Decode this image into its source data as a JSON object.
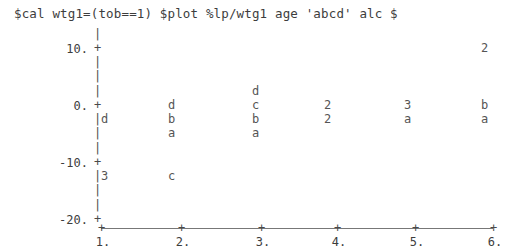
{
  "terminal": {
    "command": "$cal wtg1=(tob==1) $plot %lp/wtg1 age 'abcd' alc $",
    "foreground_color": "#4a4a4a",
    "background_color": "#ffffff"
  },
  "chart_data": {
    "type": "scatter",
    "title": "",
    "xlabel": "",
    "ylabel": "",
    "xlim": [
      1,
      6
    ],
    "ylim": [
      -20,
      10
    ],
    "grid": false,
    "legend": "none",
    "axis_style": "ascii",
    "y_ticks": [
      "10.",
      "0.",
      "-10.",
      "-20."
    ],
    "y_tick_values": [
      10,
      0,
      -10,
      -20
    ],
    "x_ticks": [
      "1.",
      "2.",
      "3.",
      "4.",
      "5.",
      "6."
    ],
    "x_tick_values": [
      1,
      2,
      3,
      4,
      5,
      6
    ],
    "axis_vertical_glyph": "|",
    "axis_tick_glyph": "+",
    "points": [
      {
        "label": "2",
        "x": 6.0,
        "y": 10.0
      },
      {
        "label": "d",
        "x": 3.0,
        "y": 3.0
      },
      {
        "label": "d",
        "x": 2.0,
        "y": 0.0
      },
      {
        "label": "c",
        "x": 3.0,
        "y": 0.0
      },
      {
        "label": "2",
        "x": 4.0,
        "y": 0.0
      },
      {
        "label": "3",
        "x": 5.0,
        "y": 0.0
      },
      {
        "label": "b",
        "x": 6.0,
        "y": 0.0
      },
      {
        "label": "d",
        "x": 1.0,
        "y": -3.0
      },
      {
        "label": "b",
        "x": 2.0,
        "y": -3.0
      },
      {
        "label": "b",
        "x": 3.0,
        "y": -3.0
      },
      {
        "label": "2",
        "x": 4.0,
        "y": -3.0
      },
      {
        "label": "a",
        "x": 5.0,
        "y": -3.0
      },
      {
        "label": "a",
        "x": 6.0,
        "y": -3.0
      },
      {
        "label": "a",
        "x": 2.0,
        "y": -6.0
      },
      {
        "label": "a",
        "x": 3.0,
        "y": -6.0
      },
      {
        "label": "3",
        "x": 1.0,
        "y": -13.0
      },
      {
        "label": "c",
        "x": 2.0,
        "y": -13.0
      }
    ]
  },
  "layout": {
    "y_tick_rows": [
      {
        "label": "10.",
        "top": 42
      },
      {
        "label": "0.",
        "top": 99
      },
      {
        "label": "-10.",
        "top": 156
      },
      {
        "label": "-20.",
        "top": 213
      }
    ],
    "axis_column_left": 94,
    "axis_vertical_rows": [
      28,
      56,
      70,
      85,
      113,
      127,
      142,
      170,
      184,
      199
    ],
    "x_tick_positions": [
      98,
      178,
      258,
      334,
      412,
      490
    ],
    "point_positions": [
      {
        "label": "2",
        "left": 481,
        "top": 42
      },
      {
        "label": "d",
        "left": 252,
        "top": 85
      },
      {
        "label": "d",
        "left": 168,
        "top": 99
      },
      {
        "label": "c",
        "left": 252,
        "top": 99
      },
      {
        "label": "2",
        "left": 324,
        "top": 99
      },
      {
        "label": "3",
        "left": 404,
        "top": 99
      },
      {
        "label": "b",
        "left": 481,
        "top": 99
      },
      {
        "label": "d",
        "left": 101,
        "top": 113
      },
      {
        "label": "b",
        "left": 168,
        "top": 113
      },
      {
        "label": "b",
        "left": 252,
        "top": 113
      },
      {
        "label": "2",
        "left": 324,
        "top": 113
      },
      {
        "label": "a",
        "left": 404,
        "top": 113
      },
      {
        "label": "a",
        "left": 481,
        "top": 113
      },
      {
        "label": "a",
        "left": 168,
        "top": 127
      },
      {
        "label": "a",
        "left": 252,
        "top": 127
      },
      {
        "label": "3",
        "left": 101,
        "top": 170
      },
      {
        "label": "c",
        "left": 168,
        "top": 170
      }
    ]
  }
}
